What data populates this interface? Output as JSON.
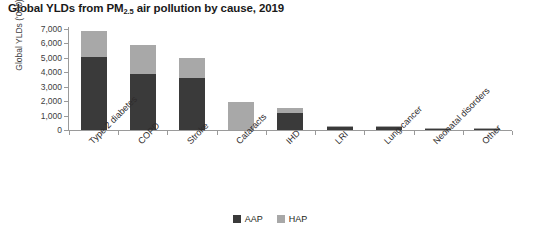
{
  "chart_data": {
    "type": "bar",
    "subtype": "stacked-vertical",
    "title": "Global YLDs from PM2.5 air pollution by cause, 2019",
    "title_prefix": "Global YLDs from PM",
    "title_subscript": "2.5",
    "title_suffix": " air pollution by cause, 2019",
    "xlabel": "",
    "ylabel": "Global YLDs ('000)",
    "ylim": [
      0,
      7000
    ],
    "ytick_values": [
      7000,
      6000,
      5000,
      4000,
      3000,
      2000,
      1000,
      0
    ],
    "ytick_labels": [
      "7,000",
      "6,000",
      "5,000",
      "4,000",
      "3,000",
      "2,000",
      "1,000",
      "0"
    ],
    "grid": false,
    "legend_position": "bottom-center",
    "categories": [
      "Type 2 diabetes",
      "COPD",
      "Stroke",
      "Cataracts",
      "IHD",
      "LRI",
      "Lung cancer",
      "Neonatal disorders",
      "Other"
    ],
    "series": [
      {
        "name": "AAP",
        "color": "#3a3a3a",
        "values": [
          5050,
          3850,
          3600,
          0,
          1200,
          230,
          230,
          40,
          20
        ]
      },
      {
        "name": "HAP",
        "color": "#a8a8a8",
        "values": [
          1800,
          2050,
          1400,
          1950,
          350,
          30,
          20,
          30,
          10
        ]
      }
    ],
    "totals": [
      6850,
      5900,
      5000,
      1950,
      1550,
      260,
      250,
      70,
      30
    ]
  },
  "legend": {
    "items": [
      {
        "label": "AAP",
        "color": "#3a3a3a"
      },
      {
        "label": "HAP",
        "color": "#a8a8a8"
      }
    ]
  }
}
